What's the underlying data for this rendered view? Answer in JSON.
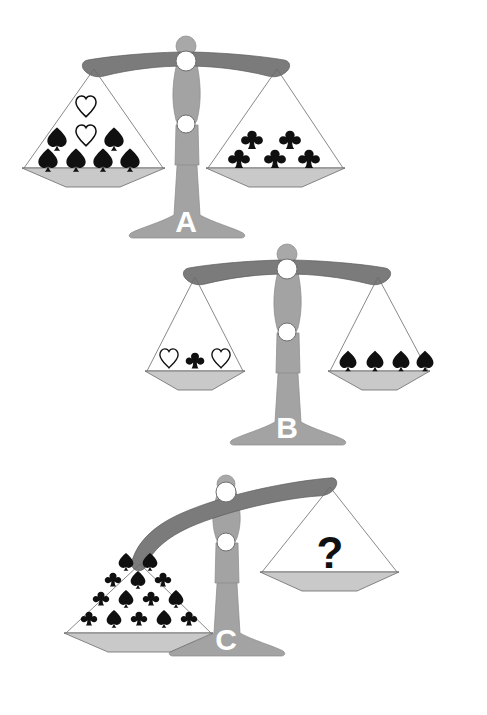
{
  "page": {
    "background_color": "#ffffff",
    "width": 487,
    "height": 715
  },
  "palette": {
    "beam": "#7b7b7b",
    "column": "#a3a3a3",
    "pan_bowl": "#c9c9c9",
    "pivot": "#ffffff",
    "symbol_filled": "#101010",
    "symbol_open": "#ffffff",
    "letter": "#ffffff",
    "question_mark": "#101010"
  },
  "scales": [
    {
      "id": "scale-a",
      "label": "A",
      "state": "balanced",
      "tilt_degrees": 0,
      "left_pan": {
        "name": "left-pan",
        "item_count": 8,
        "rows": [
          [
            "heart"
          ],
          [
            "spade",
            "heart",
            "spade"
          ],
          [
            "spade",
            "spade",
            "spade",
            "spade"
          ]
        ],
        "summary": "2 hearts and 6 spades"
      },
      "right_pan": {
        "name": "right-pan",
        "item_count": 5,
        "rows": [
          [
            "club",
            "club"
          ],
          [
            "club",
            "club",
            "club"
          ]
        ],
        "summary": "5 clubs"
      }
    },
    {
      "id": "scale-b",
      "label": "B",
      "state": "balanced",
      "tilt_degrees": 0,
      "left_pan": {
        "name": "left-pan",
        "item_count": 3,
        "rows": [
          [
            "heart",
            "club",
            "heart"
          ]
        ],
        "summary": "2 hearts and 1 club"
      },
      "right_pan": {
        "name": "right-pan",
        "item_count": 4,
        "rows": [
          [
            "spade",
            "spade",
            "spade",
            "spade"
          ]
        ],
        "summary": "4 spades"
      }
    },
    {
      "id": "scale-c",
      "label": "C",
      "state": "tilted-left",
      "tilt_degrees": -17,
      "left_pan": {
        "name": "left-pan",
        "item_count": 14,
        "rows": [
          [
            "spade",
            "spade"
          ],
          [
            "club",
            "spade",
            "club"
          ],
          [
            "club",
            "spade",
            "club",
            "spade"
          ],
          [
            "club",
            "spade",
            "club",
            "spade",
            "club"
          ]
        ],
        "summary": "7 spades and 7 clubs"
      },
      "right_pan": {
        "name": "right-pan",
        "item_count": 0,
        "rows": [],
        "unknown_marker": "?",
        "summary": "unknown quantity"
      }
    }
  ],
  "symbols": {
    "heart": {
      "name": "heart-symbol",
      "style": "outline"
    },
    "spade": {
      "name": "spade-symbol",
      "style": "filled"
    },
    "club": {
      "name": "club-symbol",
      "style": "filled"
    }
  }
}
